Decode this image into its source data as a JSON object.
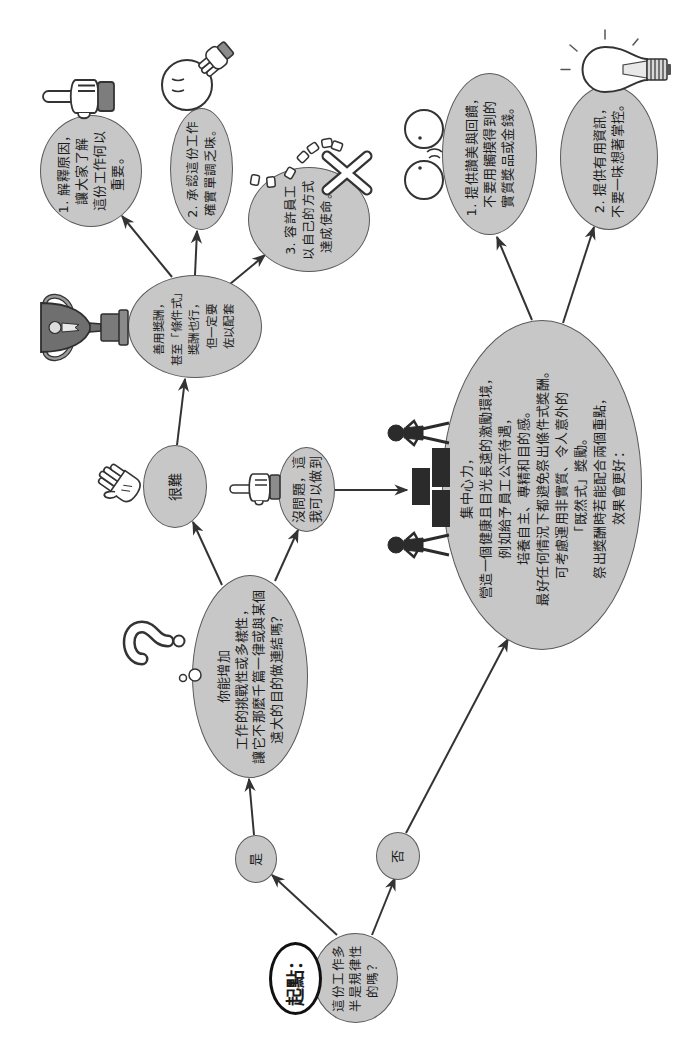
{
  "diagram": {
    "colors": {
      "node_fill": "#c7c7c7",
      "node_stroke": "#5a5a5a",
      "arrow": "#333333",
      "start_badge_fill": "#ffffff",
      "start_badge_border": "#111111",
      "icon_dark": "#2b2b2b"
    },
    "start": {
      "badge": "起點：",
      "lines": [
        "這份工作多",
        "半是規律性",
        "的嗎？"
      ]
    },
    "branch_yes": {
      "label": "是"
    },
    "branch_no": {
      "label": "否"
    },
    "question": {
      "lines": [
        "你能增加",
        "工作的挑戰性或多樣性，",
        "讓它不那麼千篇一律或與某個",
        "遠大的目的做連結嗎？"
      ]
    },
    "answer_hard": {
      "label": "很難"
    },
    "answer_can_do": {
      "lines": [
        "沒問題，這",
        "我可以做到"
      ]
    },
    "rewards": {
      "lines": [
        "善用獎酬，",
        "甚至「條件式」",
        "獎酬也行，",
        "但一定要",
        "佐以配套"
      ]
    },
    "tip_explain": {
      "lines": [
        "1. 解釋原因，",
        "讓大家了解",
        "這份工作何以",
        "重要。"
      ]
    },
    "tip_acknowledge": {
      "lines": [
        "2. 承認這份工作",
        "確實單調乏味。"
      ]
    },
    "tip_autonomy": {
      "lines": [
        "3. 容許員工",
        "以自己的方式",
        "達成使命。"
      ]
    },
    "focus": {
      "lines": [
        "集中心力，",
        "營造一個健康且目光長遠的激勵環境，",
        "例如給予員工公平待遇，",
        "培養自主、專精和目的感。",
        "最好任何情況下都避免祭出條件式獎酬。",
        "可考慮運用非實質、令人意外的",
        "「既然式」獎勵。",
        "祭出獎酬時若能配合兩個重點，",
        "效果會更好："
      ]
    },
    "tip_praise": {
      "lines": [
        "1. 提供讚美與回饋，",
        "不要用觸摸得到的",
        "實質獎品或金錢。"
      ]
    },
    "tip_information": {
      "lines": [
        "2. 提供有用資訊，",
        "不要一味想著掌控。"
      ]
    },
    "icons": {
      "start": "start-badge",
      "question": "question-mark-icon",
      "thought": "thought-bubbles-icon",
      "hard": "open-hand-icon",
      "can_do": "pointing-hand-icon",
      "rewards": "trophy-icon",
      "explain": "pointing-finger-icon",
      "acknowledge": "thinking-face-icon",
      "autonomy": "broken-chain-x-icon",
      "focus": "people-podium-icon",
      "praise": "talking-faces-icon",
      "information": "lightbulb-icon"
    }
  }
}
